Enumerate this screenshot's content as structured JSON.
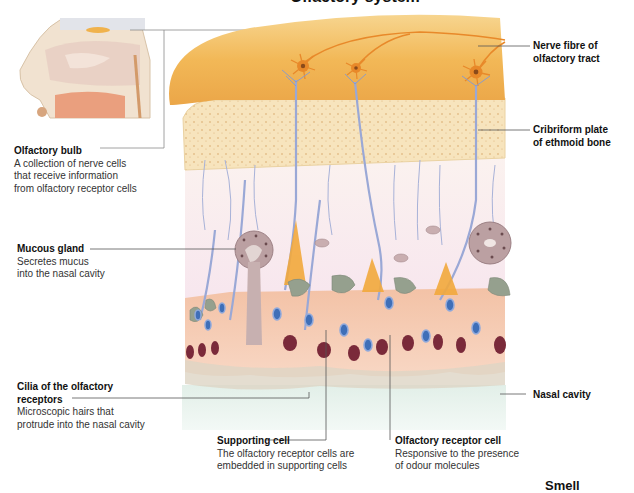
{
  "diagram": {
    "title_cropped": "Olfactory system",
    "bottom_right_cropped": "Smell"
  },
  "labels": {
    "olfactory_bulb": {
      "title": "Olfactory bulb",
      "desc": "A collection of nerve cells\nthat receive information\nfrom olfactory receptor cells"
    },
    "mucous_gland": {
      "title": "Mucous gland",
      "desc": "Secretes mucus\ninto the nasal cavity"
    },
    "cilia": {
      "title": "Cilia of the olfactory\nreceptors",
      "desc": "Microscopic hairs that\nprotrude into the nasal cavity"
    },
    "supporting_cell": {
      "title": "Supporting cell",
      "desc": "The olfactory receptor cells are\nembedded in supporting cells"
    },
    "olfactory_receptor_cell": {
      "title": "Olfactory receptor cell",
      "desc": "Responsive to the presence\nof odour molecules"
    },
    "nerve_fibre": {
      "title": "Nerve fibre of\nolfactory tract"
    },
    "cribriform_plate": {
      "title": "Cribriform plate\nof ethmoid bone"
    },
    "nasal_cavity": {
      "title": "Nasal cavity"
    }
  },
  "colors": {
    "bulb": "#f2b857",
    "bone": "#f5dfb0",
    "epithelium": "#f6c9b0",
    "nasal_cavity": "#e4f1ea",
    "receptor_nucleus": "#3f6fb8",
    "supporting_nucleus": "#7a2a3a",
    "basal_cell": "#8f9a86",
    "nerve": "#9aa8d6",
    "leader_line": "#555555"
  }
}
